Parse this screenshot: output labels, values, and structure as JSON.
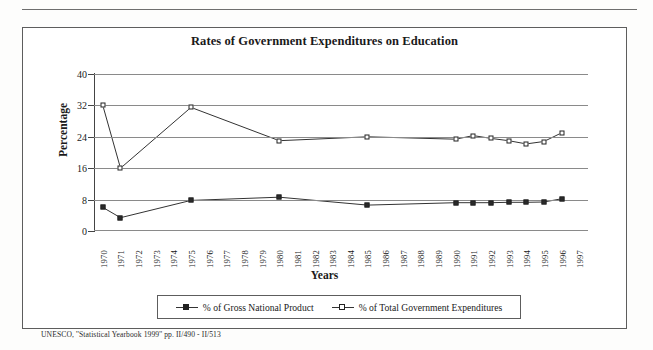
{
  "figure": {
    "title": "Rates of Government Expenditures on Education",
    "source_note": "UNESCO, ''Statistical Yearbook 1999'' pp. II/490 - II/513"
  },
  "chart_data": {
    "type": "line",
    "title": "Rates of Government Expenditures on Education",
    "xlabel": "Years",
    "ylabel": "Percentage",
    "ylim": [
      0,
      40
    ],
    "yticks": [
      0,
      8,
      16,
      24,
      32,
      40
    ],
    "grid": "horizontal",
    "legend_position": "bottom",
    "categories": [
      "1970",
      "1971",
      "1972",
      "1973",
      "1974",
      "1975",
      "1976",
      "1977",
      "1978",
      "1979",
      "1980",
      "1981",
      "1982",
      "1983",
      "1984",
      "1985",
      "1986",
      "1987",
      "1988",
      "1989",
      "1990",
      "1991",
      "1992",
      "1993",
      "1994",
      "1995",
      "1996",
      "1997"
    ],
    "series": [
      {
        "name": "% of Gross National Product",
        "marker": "filled-square",
        "points": [
          {
            "x": "1970",
            "y": 6.0
          },
          {
            "x": "1971",
            "y": 3.4
          },
          {
            "x": "1975",
            "y": 7.8
          },
          {
            "x": "1980",
            "y": 8.6
          },
          {
            "x": "1985",
            "y": 6.6
          },
          {
            "x": "1990",
            "y": 7.2
          },
          {
            "x": "1991",
            "y": 7.2
          },
          {
            "x": "1992",
            "y": 7.2
          },
          {
            "x": "1993",
            "y": 7.3
          },
          {
            "x": "1994",
            "y": 7.3
          },
          {
            "x": "1995",
            "y": 7.4
          },
          {
            "x": "1996",
            "y": 8.2
          }
        ]
      },
      {
        "name": "% of Total Government Expenditures",
        "marker": "open-square",
        "points": [
          {
            "x": "1970",
            "y": 32.0
          },
          {
            "x": "1971",
            "y": 16.0
          },
          {
            "x": "1975",
            "y": 31.5
          },
          {
            "x": "1980",
            "y": 23.0
          },
          {
            "x": "1985",
            "y": 24.0
          },
          {
            "x": "1990",
            "y": 23.4
          },
          {
            "x": "1991",
            "y": 24.3
          },
          {
            "x": "1992",
            "y": 23.6
          },
          {
            "x": "1993",
            "y": 23.0
          },
          {
            "x": "1994",
            "y": 22.2
          },
          {
            "x": "1995",
            "y": 22.8
          },
          {
            "x": "1996",
            "y": 25.0
          }
        ]
      }
    ]
  },
  "legend": {
    "entries": [
      {
        "label": "% of Gross National Product",
        "marker": "filled-square"
      },
      {
        "label": "% of Total Government Expenditures",
        "marker": "open-square"
      }
    ]
  },
  "colors": {
    "line": "#333333",
    "grid": "#8a8a8a",
    "axis": "#444444",
    "border": "#5d5d5d"
  }
}
